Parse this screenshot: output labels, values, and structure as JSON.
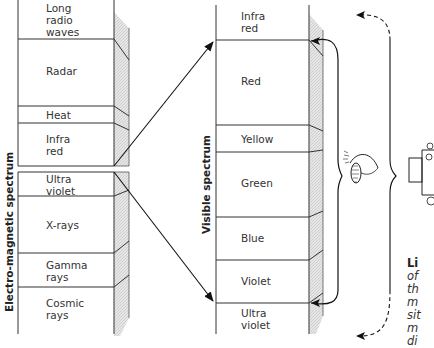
{
  "diagram": {
    "em_spectrum": {
      "axis_label": "Electro-magnetic spectrum",
      "bands": [
        {
          "label": "Long\nradio\nwaves"
        },
        {
          "label": "Radar"
        },
        {
          "label": "Heat"
        },
        {
          "label": "Infra\nred"
        },
        {
          "label": "Ultra\nviolet"
        },
        {
          "label": "X-rays"
        },
        {
          "label": "Gamma\nrays"
        },
        {
          "label": "Cosmic\nrays"
        }
      ]
    },
    "visible_spectrum": {
      "axis_label": "Visible spectrum",
      "bands": [
        {
          "label": "Infra\nred"
        },
        {
          "label": "Red"
        },
        {
          "label": "Yellow"
        },
        {
          "label": "Green"
        },
        {
          "label": "Blue"
        },
        {
          "label": "Violet"
        },
        {
          "label": "Ultra\nviolet"
        }
      ]
    },
    "illustrations": {
      "eye": "eye-icon",
      "camera": "camera-icon"
    },
    "caption": {
      "title": "Li",
      "lines": [
        "of",
        "th",
        "m",
        "sit",
        "m",
        "di"
      ]
    }
  }
}
